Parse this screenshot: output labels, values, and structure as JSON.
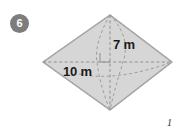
{
  "page": {
    "background_color": "#ffffff",
    "width": 181,
    "height": 133
  },
  "question": {
    "number": "6",
    "badge_color": "#7d7d7d",
    "badge_text_color": "#ffffff"
  },
  "figure": {
    "shape_name": "rhombus",
    "fill_color": "#d6d6d6",
    "stroke_color": "#8a8a8a",
    "dash_color": "#9a9a9a",
    "right_angle_marker": "right-angle",
    "vertices": {
      "top": [
        77,
        7
      ],
      "left": [
        10,
        54
      ],
      "right": [
        139,
        54
      ],
      "bottom": [
        77,
        102
      ]
    },
    "labels": {
      "height": "7 m",
      "base": "10 m"
    }
  },
  "artifact": {
    "mark": "1"
  }
}
